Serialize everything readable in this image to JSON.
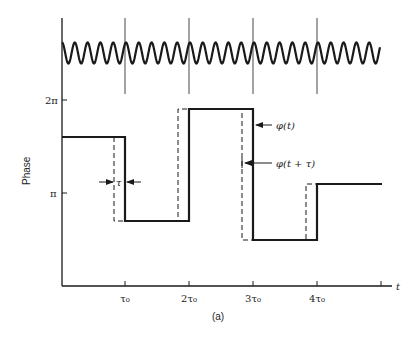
{
  "figure": {
    "caption": "(a)",
    "y_axis_label": "Phase",
    "x_axis_label": "t",
    "y_ticks": [
      {
        "label": "2π",
        "y": 100
      },
      {
        "label": "π",
        "y": 193
      }
    ],
    "x_ticks": [
      {
        "label": "τ₀",
        "x": 125
      },
      {
        "label": "2τ₀",
        "x": 189
      },
      {
        "label": "3τ₀",
        "x": 253
      },
      {
        "label": "4τ₀",
        "x": 317
      },
      {
        "label": "",
        "x": 381
      }
    ],
    "annotations": {
      "phi_t": "φ(t)",
      "phi_t_tau": "φ(t + τ)",
      "tau": "τ"
    },
    "colors": {
      "ink": "#1a1a1a",
      "background": "#ffffff"
    }
  },
  "chart_data": {
    "type": "line",
    "title": "",
    "xlabel": "t",
    "ylabel": "Phase",
    "x_ticks": [
      "τ₀",
      "2τ₀",
      "3τ₀",
      "4τ₀"
    ],
    "y_ticks": [
      "π",
      "2π"
    ],
    "series": [
      {
        "name": "φ(t)",
        "style": "solid",
        "segments": [
          {
            "t_start": 0,
            "t_end": 1,
            "phase_over_pi": 1.6
          },
          {
            "t_start": 1,
            "t_end": 2,
            "phase_over_pi": 0.7
          },
          {
            "t_start": 2,
            "t_end": 3,
            "phase_over_pi": 1.9
          },
          {
            "t_start": 3,
            "t_end": 4,
            "phase_over_pi": 0.5
          },
          {
            "t_start": 4,
            "t_end": 5,
            "phase_over_pi": 1.1
          }
        ]
      },
      {
        "name": "φ(t + τ)",
        "style": "dashed",
        "note": "same as φ(t) shifted left by τ"
      },
      {
        "name": "carrier",
        "style": "solid",
        "note": "sinusoid with phase jumps at multiples of τ₀, ~5 cycles per τ₀"
      }
    ]
  }
}
